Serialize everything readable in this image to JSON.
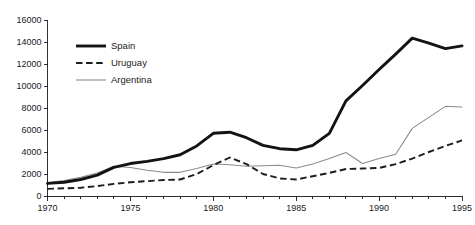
{
  "chart_data": {
    "type": "line",
    "title": "",
    "subtitle": "",
    "xlabel": "",
    "ylabel": "",
    "xlim": [
      1970,
      1995
    ],
    "ylim": [
      0,
      16000
    ],
    "grid": false,
    "legend_position": "top-left",
    "x": [
      1970,
      1971,
      1972,
      1973,
      1974,
      1975,
      1976,
      1977,
      1978,
      1979,
      1980,
      1981,
      1982,
      1983,
      1984,
      1985,
      1986,
      1987,
      1988,
      1989,
      1990,
      1991,
      1992,
      1993,
      1994,
      1995
    ],
    "x_tick_labels": [
      "1970",
      "1975",
      "1980",
      "1985",
      "1990",
      "1995"
    ],
    "x_tick_values": [
      1970,
      1975,
      1980,
      1985,
      1990,
      1995
    ],
    "y_tick_labels": [
      "0",
      "2000",
      "4000",
      "6000",
      "8000",
      "10000",
      "12000",
      "14000",
      "16000"
    ],
    "y_tick_values": [
      0,
      2000,
      4000,
      6000,
      8000,
      10000,
      12000,
      14000,
      16000
    ],
    "series": [
      {
        "name": "Spain",
        "color": "#131313",
        "style": "solid-thick",
        "values": [
          1150,
          1250,
          1500,
          1900,
          2600,
          2950,
          3150,
          3400,
          3750,
          4550,
          5700,
          5800,
          5300,
          4600,
          4300,
          4200,
          4600,
          5700,
          8650,
          10050,
          11500,
          12900,
          14350,
          13900,
          13400,
          13650
        ]
      },
      {
        "name": "Uruguay",
        "color": "#1d1d1d",
        "style": "dashed",
        "values": [
          650,
          700,
          750,
          900,
          1100,
          1250,
          1350,
          1450,
          1500,
          2000,
          2800,
          3500,
          2900,
          2000,
          1600,
          1500,
          1800,
          2100,
          2450,
          2500,
          2550,
          2900,
          3400,
          4000,
          4550,
          5050
        ]
      },
      {
        "name": "Argentina",
        "color": "#8b8b8b",
        "style": "solid-thin",
        "values": [
          1200,
          1400,
          1700,
          2100,
          2700,
          2600,
          2350,
          2150,
          2150,
          2500,
          2900,
          2850,
          2700,
          2750,
          2800,
          2550,
          2900,
          3400,
          3950,
          2950,
          3400,
          3800,
          6150,
          7150,
          8150,
          8100
        ]
      }
    ]
  },
  "legend": {
    "items": [
      {
        "label": "Spain"
      },
      {
        "label": "Uruguay"
      },
      {
        "label": "Argentina"
      }
    ]
  }
}
